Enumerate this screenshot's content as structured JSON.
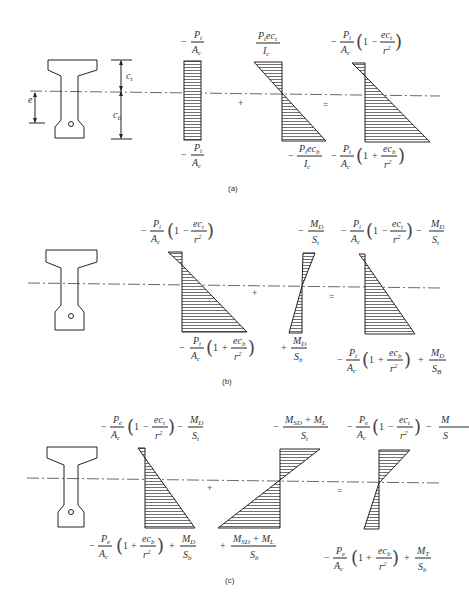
{
  "figure": {
    "label_top": "g",
    "panels": [
      {
        "id": "a",
        "caption": "(a)",
        "section_labels": {
          "ct": "c",
          "ct_sub": "t",
          "cb": "c",
          "cb_sub": "b",
          "e": "e"
        },
        "operators": [
          "+",
          "="
        ],
        "terms": [
          {
            "name": "axial-stress",
            "top": "−Pi/Ac",
            "bottom": "−Pi/Ac"
          },
          {
            "name": "eccentric-stress",
            "top": "Pi·e·ct/Ic",
            "bottom": "−Pi·e·cb/Ic"
          },
          {
            "name": "resultant-stress",
            "top": "−(Pi/Ac)(1 − e·ct/r²)",
            "bottom": "−(Pi/Ac)(1 + e·cb/r²)"
          }
        ]
      },
      {
        "id": "b",
        "caption": "(b)",
        "operators": [
          "+",
          "="
        ],
        "terms": [
          {
            "name": "prestress-stress",
            "top": "−(Pi/Ac)(1 − e·ct/r²)",
            "bottom": "−(Pi/Ac)(1 + e·cb/r²)"
          },
          {
            "name": "dead-load-stress",
            "top": "−MD/St",
            "bottom": "+MD/Sb"
          },
          {
            "name": "resultant-stress",
            "top": "−(Pi/Ac)(1 − e·ct/r²) − MD/St",
            "bottom": "−(Pi/Ac)(1 + e·cb/r²) + MD/SB"
          }
        ]
      },
      {
        "id": "c",
        "caption": "(c)",
        "operators": [
          "+",
          "="
        ],
        "terms": [
          {
            "name": "effective-prestress-dead-stress",
            "top": "−(Pe/Ac)(1 − e·ct/r²) − MD/St",
            "bottom": "−(Pe/Ac)(1 + e·cb/r²) + MD/Sb"
          },
          {
            "name": "superimposed-live-stress",
            "top": "−(MSD + ML)/St",
            "bottom": "+(MSD + ML)/Sb"
          },
          {
            "name": "resultant-stress",
            "top": "−(Pe/Ac)(1 − e·ct/r²) − M/S",
            "bottom": "−(Pe/Ac)(1 + e·cb/r²) + MT/Sb"
          }
        ]
      }
    ]
  },
  "glyphs": {
    "minus": "−",
    "plus": "+",
    "equals": "=",
    "one": "1",
    "P": "P",
    "i": "i",
    "e_sub": "e",
    "A": "A",
    "c": "c",
    "I": "I",
    "ec": "ec",
    "t": "t",
    "b": "b",
    "r": "r",
    "sq": "2",
    "M": "M",
    "D": "D",
    "S": "S",
    "B": "B",
    "T": "T",
    "SD": "SD",
    "L": "L",
    "lp": "(",
    "rp": ")",
    "MSD_ML_plus": " + ",
    "cut_M": "M",
    "cut_S": "S"
  }
}
